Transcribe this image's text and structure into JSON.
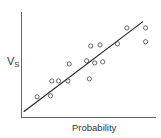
{
  "chart_data": {
    "type": "scatter",
    "title": "",
    "xlabel": "Probability",
    "ylabel": "V",
    "ylabel_subscript": "S",
    "grid": false,
    "legend": null,
    "ticks": {
      "x": [],
      "y": []
    },
    "xlim": [
      0,
      100
    ],
    "ylim": [
      0,
      100
    ],
    "points": [
      {
        "x": 12,
        "y": 19
      },
      {
        "x": 22,
        "y": 20
      },
      {
        "x": 23,
        "y": 34
      },
      {
        "x": 28,
        "y": 34
      },
      {
        "x": 35,
        "y": 34
      },
      {
        "x": 36,
        "y": 50
      },
      {
        "x": 51,
        "y": 36
      },
      {
        "x": 49,
        "y": 53
      },
      {
        "x": 52,
        "y": 67
      },
      {
        "x": 55,
        "y": 51
      },
      {
        "x": 59,
        "y": 68
      },
      {
        "x": 61,
        "y": 52
      },
      {
        "x": 72,
        "y": 69
      },
      {
        "x": 79,
        "y": 84
      },
      {
        "x": 93,
        "y": 84
      },
      {
        "x": 93,
        "y": 71
      }
    ],
    "trend_line": {
      "x1": 2,
      "y1": 5,
      "x2": 91,
      "y2": 90
    },
    "colors": {
      "axis": "#555555",
      "line": "#222222",
      "marker": "#444444"
    }
  }
}
